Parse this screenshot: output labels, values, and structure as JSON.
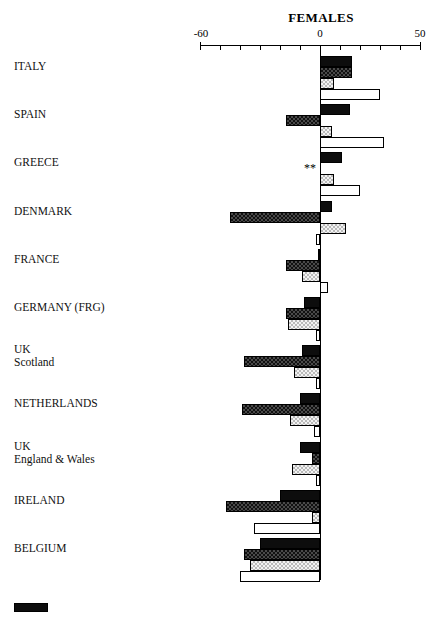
{
  "chart_data": {
    "type": "bar",
    "orientation": "horizontal",
    "title": "FEMALES",
    "xlabel": "",
    "ylabel": "",
    "xlim": [
      -60,
      50
    ],
    "xticks": [
      -60,
      -50,
      -40,
      -30,
      -20,
      -10,
      0,
      10,
      20,
      30,
      40,
      50
    ],
    "xtick_labels_shown": [
      "-60",
      "0",
      "50"
    ],
    "grid": false,
    "legend_position": "bottom",
    "zero_reference_line": true,
    "missing_value_marker": "**",
    "categories": [
      "ITALY",
      "SPAIN",
      "GREECE",
      "DENMARK",
      "FRANCE",
      "GERMANY (FRG)",
      "UK\nScotland",
      "NETHERLANDS",
      "UK\nEngland & Wales",
      "IRELAND",
      "BELGIUM"
    ],
    "series": [
      {
        "name": "series-1",
        "style": "solid-black",
        "color": "#0d0d0d",
        "values": [
          16,
          15,
          11,
          6,
          -1,
          -8,
          -9,
          -10,
          -10,
          -20,
          -30
        ]
      },
      {
        "name": "series-2",
        "style": "dark-checkered",
        "color": "#4a4a4a",
        "values": [
          16,
          -17,
          null,
          -45,
          -17,
          -17,
          -38,
          -39,
          -4,
          -47,
          -38
        ]
      },
      {
        "name": "series-3",
        "style": "light-stipple",
        "color": "#f2f2f2",
        "values": [
          7,
          6,
          7,
          13,
          -9,
          -16,
          -13,
          -15,
          -14,
          -4,
          -35
        ]
      },
      {
        "name": "series-4",
        "style": "white-outline",
        "color": "#ffffff",
        "values": [
          30,
          32,
          20,
          -2,
          4,
          -2,
          -2,
          -3,
          -2,
          -33,
          -40
        ]
      }
    ]
  },
  "axis": {
    "left_label": "-60",
    "center_label": "0",
    "right_label": "50"
  },
  "legend": {
    "swatch_style": "solid-black"
  }
}
